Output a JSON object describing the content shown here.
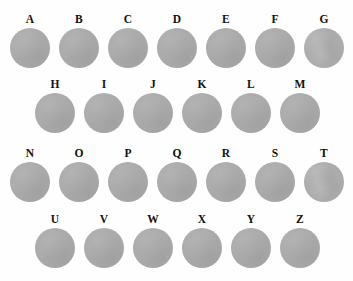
{
  "figure": {
    "background_color": "#fefefe",
    "disc_color": "#abaaaa",
    "label_color": "#111111",
    "rows": [
      {
        "row_name": "row-1",
        "left": 10,
        "top": 13,
        "items": [
          {
            "label": "A",
            "texture": "smooth"
          },
          {
            "label": "B",
            "texture": "smooth"
          },
          {
            "label": "C",
            "texture": "smooth"
          },
          {
            "label": "D",
            "texture": "smooth"
          },
          {
            "label": "E",
            "texture": "smooth"
          },
          {
            "label": "F",
            "texture": "smooth"
          },
          {
            "label": "G",
            "texture": "mottled"
          }
        ]
      },
      {
        "row_name": "row-2",
        "left": 35,
        "top": 78,
        "items": [
          {
            "label": "H",
            "texture": "smooth"
          },
          {
            "label": "I",
            "texture": "smooth"
          },
          {
            "label": "J",
            "texture": "smooth"
          },
          {
            "label": "K",
            "texture": "smooth"
          },
          {
            "label": "L",
            "texture": "smooth"
          },
          {
            "label": "M",
            "texture": "smooth"
          }
        ]
      },
      {
        "row_name": "row-3",
        "left": 10,
        "top": 147,
        "items": [
          {
            "label": "N",
            "texture": "smooth"
          },
          {
            "label": "O",
            "texture": "smooth"
          },
          {
            "label": "P",
            "texture": "smooth"
          },
          {
            "label": "Q",
            "texture": "smooth"
          },
          {
            "label": "R",
            "texture": "smooth"
          },
          {
            "label": "S",
            "texture": "smooth"
          },
          {
            "label": "T",
            "texture": "mottled"
          }
        ]
      },
      {
        "row_name": "row-4",
        "left": 35,
        "top": 213,
        "items": [
          {
            "label": "U",
            "texture": "smooth"
          },
          {
            "label": "V",
            "texture": "smooth"
          },
          {
            "label": "W",
            "texture": "smooth"
          },
          {
            "label": "X",
            "texture": "smooth"
          },
          {
            "label": "Y",
            "texture": "smooth"
          },
          {
            "label": "Z",
            "texture": "smooth"
          }
        ]
      }
    ]
  }
}
